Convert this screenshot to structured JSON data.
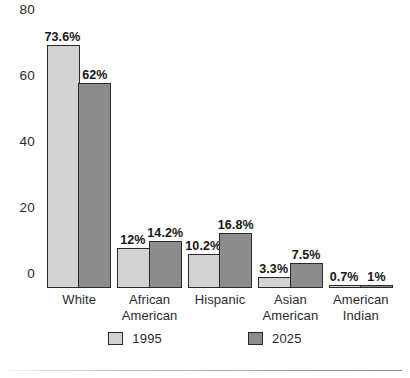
{
  "chart_data": {
    "type": "bar",
    "title": "",
    "subtitle": "",
    "xlabel": "",
    "ylabel": "",
    "ylim": [
      0,
      80
    ],
    "yticks": [
      "0",
      "20",
      "40",
      "60",
      "80"
    ],
    "ytick_values": [
      0,
      20,
      40,
      60,
      80
    ],
    "grid": false,
    "legend_position": "bottom",
    "categories": [
      "White",
      "African\nAmerican",
      "Hispanic",
      "Asian\nAmerican",
      "American\nIndian"
    ],
    "series": [
      {
        "name": "1995",
        "color": "#d2d2d2",
        "values": [
          73.6,
          12,
          10.2,
          3.3,
          0.7
        ],
        "labels": [
          "73.6%",
          "12%",
          "10.2%",
          "3.3%",
          "0.7%"
        ]
      },
      {
        "name": "2025",
        "color": "#8c8c8c",
        "values": [
          62,
          14.2,
          16.8,
          7.5,
          1
        ],
        "labels": [
          "62%",
          "14.2%",
          "16.8%",
          "7.5%",
          "1%"
        ]
      }
    ]
  },
  "legend": {
    "items": [
      {
        "label": "1995",
        "color": "#d2d2d2"
      },
      {
        "label": "2025",
        "color": "#8c8c8c"
      }
    ]
  },
  "colors": {
    "series_1995": "#d2d2d2",
    "series_2025": "#8c8c8c",
    "outline": "#2a2a2a",
    "text": "#2b2b2b",
    "background": "#ffffff"
  }
}
